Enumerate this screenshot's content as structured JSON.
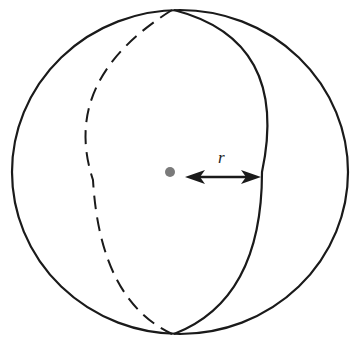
{
  "diagram": {
    "radius_label": "r",
    "colors": {
      "stroke": "#1a1a1a",
      "center_dot": "#7a7a7a",
      "background": "#ffffff"
    },
    "elements": [
      "outer-circle",
      "front-meridian-solid",
      "back-meridian-dashed",
      "center-point",
      "radius-arrow",
      "radius-label"
    ]
  }
}
